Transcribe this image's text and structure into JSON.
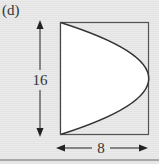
{
  "figure": {
    "label": "(d)",
    "height_label": "16",
    "width_label": "8",
    "shape": "parabolic region inscribed in rectangle",
    "colors": {
      "background": "#e6e6e6",
      "region_fill": "#ffffff",
      "stroke": "#333333"
    }
  }
}
